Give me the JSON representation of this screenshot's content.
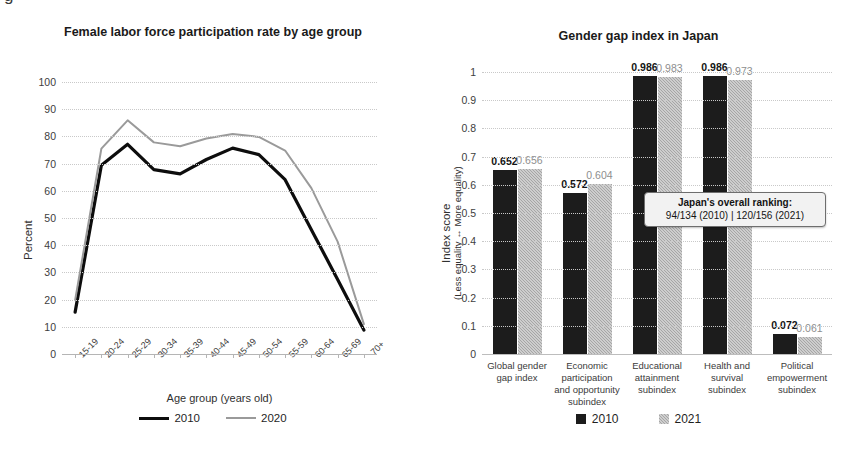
{
  "caption_stub": "g",
  "left_panel": {
    "title": "Female labor force participation rate by age group",
    "ylabel": "Percent",
    "xlabel": "Age group (years old)",
    "legend": [
      {
        "label": "2010",
        "style": "solid-black"
      },
      {
        "label": "2020",
        "style": "thin-gray"
      }
    ]
  },
  "right_panel": {
    "title": "Gender gap index in Japan",
    "ylabel_main": "Index score",
    "ylabel_sub": "(Less equality ↔ More equality)",
    "callout": {
      "header": "Japan's overall ranking:",
      "row": "94/134 (2010)   |   120/156 (2021)"
    },
    "legend": [
      {
        "label": "2010",
        "style": "black"
      },
      {
        "label": "2021",
        "style": "gray"
      }
    ]
  },
  "chart_data": [
    {
      "type": "line",
      "title": "Female labor force participation rate by age group",
      "xlabel": "Age group (years old)",
      "ylabel": "Percent",
      "ylim": [
        0,
        100
      ],
      "yticks": [
        0,
        10,
        20,
        30,
        40,
        50,
        60,
        70,
        80,
        90,
        100
      ],
      "grid": true,
      "legend_position": "bottom",
      "categories": [
        "15-19",
        "20-24",
        "25-29",
        "30-34",
        "35-39",
        "40-44",
        "45-49",
        "50-54",
        "55-59",
        "60-64",
        "65-69",
        "70+"
      ],
      "series": [
        {
          "name": "2010",
          "values": [
            15.4,
            69.4,
            77.1,
            67.8,
            66.2,
            71.5,
            75.7,
            73.3,
            64.1,
            45.7,
            27.4,
            8.8
          ]
        },
        {
          "name": "2020",
          "values": [
            19.8,
            75.5,
            85.9,
            77.8,
            76.4,
            79.2,
            80.9,
            79.8,
            74.8,
            61.0,
            41.3,
            11.0
          ]
        }
      ]
    },
    {
      "type": "bar",
      "title": "Gender gap index in Japan",
      "xlabel": "",
      "ylabel": "Index score (Less equality ↔ More equality)",
      "ylim": [
        0,
        1
      ],
      "yticks": [
        "0",
        "0.1",
        "0.2",
        "0.3",
        "0.4",
        "0.5",
        "0.6",
        "0.7",
        "0.8",
        "0.9",
        "1"
      ],
      "grid": true,
      "legend_position": "bottom",
      "categories": [
        "Global gender gap index",
        "Economic participation and opportunity subindex",
        "Educational attainment subindex",
        "Health and survival subindex",
        "Political empowerment subindex"
      ],
      "series": [
        {
          "name": "2010",
          "values": [
            0.652,
            0.572,
            0.986,
            0.986,
            0.072
          ]
        },
        {
          "name": "2021",
          "values": [
            0.656,
            0.604,
            0.983,
            0.973,
            0.061
          ]
        }
      ],
      "data_labels": {
        "2010": [
          "0.652",
          "0.572",
          "0.986",
          "0.986",
          "0.072"
        ],
        "2021": [
          "0.656",
          "0.604",
          "0.983",
          "0.973",
          "0.061"
        ]
      },
      "annotations": [
        {
          "text": "Japan's overall ranking: 94/134 (2010)  |  120/156 (2021)"
        }
      ]
    }
  ],
  "colors": {
    "series_2010": "#1c1c1c",
    "series_2020_line": "#9a9a9a",
    "series_2021_bar": "#a6a6a6",
    "grid": "#c9c9c9",
    "text": "#1a1a1a"
  }
}
